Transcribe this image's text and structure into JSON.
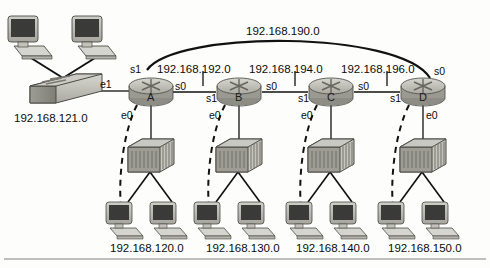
{
  "diagram": {
    "background_color": "#fdfdfc",
    "line_color": "#111111",
    "device_fill": "#b8b8b0",
    "device_shade": "#8f8f88"
  },
  "networks": {
    "wan_backup": "192.168.190.0",
    "lan_switch": "192.168.121.0",
    "serial_ab": "192.168.192.0",
    "serial_bc": "192.168.194.0",
    "serial_cd": "192.168.196.0",
    "lan_a": "192.168.120.0",
    "lan_b": "192.168.130.0",
    "lan_c": "192.168.140.0",
    "lan_d": "192.168.150.0"
  },
  "routers": [
    {
      "name": "A",
      "interfaces": {
        "left": "e1",
        "top": "s1",
        "right": "s0",
        "bottom": "e0"
      }
    },
    {
      "name": "B",
      "interfaces": {
        "left": "s1",
        "right": "s0",
        "bottom": "e0"
      }
    },
    {
      "name": "C",
      "interfaces": {
        "left": "s1",
        "right": "s0",
        "bottom": "e0"
      }
    },
    {
      "name": "D",
      "interfaces": {
        "left": "s1",
        "top_right": "s0",
        "bottom": "e0"
      }
    }
  ],
  "devices": {
    "switch_label": "switch",
    "hub_label": "hub",
    "workstation_label": "workstation"
  }
}
